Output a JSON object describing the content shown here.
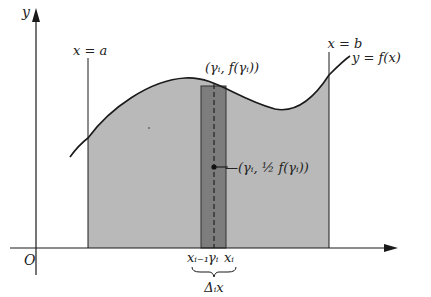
{
  "figure": {
    "type": "riemann-strip-area-diagram",
    "axes": {
      "y_label": "y",
      "origin_label": "O"
    },
    "boundaries": {
      "left_label": "x = a",
      "right_label": "x = b"
    },
    "curve_label": "y = f(x)",
    "strip": {
      "top_point_label": "(γᵢ, f(γᵢ))",
      "mid_point_label": "—(γᵢ, ½ f(γᵢ))",
      "left_tick_label": "xᵢ₋₁",
      "center_tick_label": "γᵢ",
      "right_tick_label": "xᵢ",
      "width_label": "Δᵢx"
    },
    "colors": {
      "region_fill": "#b9b9b9",
      "strip_fill": "#7d7d7d",
      "line": "#1a1a1a",
      "background": "#ffffff"
    }
  }
}
